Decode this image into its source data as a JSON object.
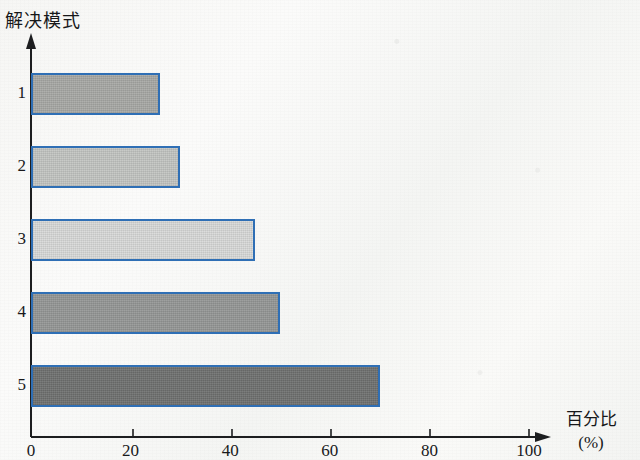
{
  "chart_data": {
    "type": "bar",
    "orientation": "horizontal",
    "title": "解决模式",
    "xlabel": "百分比",
    "xunit": "(%)",
    "ylabel": "解决模式",
    "categories": [
      "1",
      "2",
      "3",
      "4",
      "5"
    ],
    "values": [
      26,
      30,
      45,
      50,
      70
    ],
    "series": [
      {
        "name": "百分比",
        "values": [
          26,
          30,
          45,
          50,
          70
        ]
      }
    ],
    "xlim": [
      0,
      110
    ],
    "ylim": [
      0,
      5
    ],
    "xticks": [
      0,
      20,
      40,
      60,
      80,
      100
    ],
    "xtick_labels": [
      "0",
      "20",
      "40",
      "60",
      "80",
      "100"
    ],
    "ytick_labels": [
      "1",
      "2",
      "3",
      "4",
      "5"
    ],
    "grid": false,
    "legend": false,
    "bar_border_color": "#2f6fb5",
    "bar_fill_colors": [
      "#a8a9a6",
      "#c3c5c2",
      "#d9dad8",
      "#959796",
      "#6f7170"
    ],
    "axis_color": "#1d1e20",
    "background_color": "#f8f8f6"
  },
  "axis": {
    "arrow_x": "percent-axis-arrow",
    "arrow_y": "mode-axis-arrow"
  }
}
